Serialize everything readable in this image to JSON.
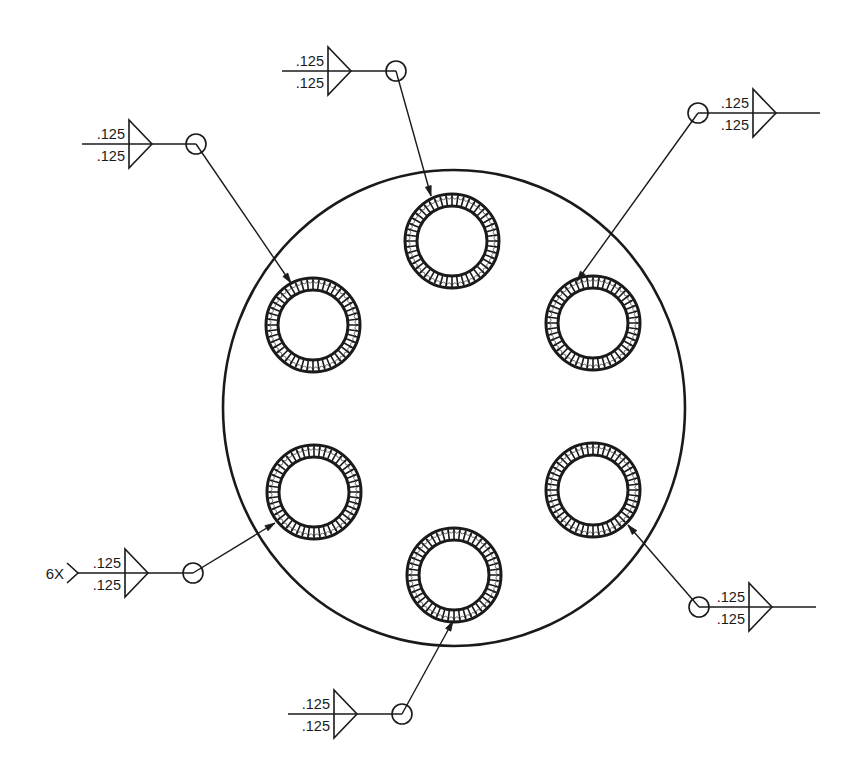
{
  "diagram": {
    "title": "",
    "type": "weld-symbol-drawing",
    "stroke_color": "#1a1a1a",
    "background": "#ffffff",
    "plate": {
      "shape": "circle",
      "center": [
        454,
        408
      ],
      "rx": 231,
      "ry": 238
    },
    "holes": [
      {
        "id": "top",
        "center": [
          452,
          241
        ]
      },
      {
        "id": "upper-left",
        "center": [
          313,
          325
        ]
      },
      {
        "id": "upper-right",
        "center": [
          593,
          323
        ]
      },
      {
        "id": "lower-left",
        "center": [
          314,
          492
        ]
      },
      {
        "id": "lower-right",
        "center": [
          593,
          490
        ]
      },
      {
        "id": "bottom",
        "center": [
          454,
          575
        ]
      }
    ],
    "weld_ring": {
      "outer_radius": 47,
      "inner_radius": 35,
      "tick_count": 48
    },
    "weld_callouts": [
      {
        "id": "top",
        "top_size": ".125",
        "bottom_size": ".125",
        "tail_prefix": "",
        "direction": "left",
        "ref_line": [
          282,
          71,
          396
        ],
        "flag_x": 328,
        "apex_x": 351,
        "circle": [
          396,
          71
        ],
        "arrow_to": [
          431,
          196
        ]
      },
      {
        "id": "upper-left",
        "top_size": ".125",
        "bottom_size": ".125",
        "tail_prefix": "",
        "direction": "left",
        "ref_line": [
          82,
          144,
          196
        ],
        "flag_x": 129,
        "apex_x": 152,
        "circle": [
          196,
          144
        ],
        "arrow_to": [
          291,
          283
        ]
      },
      {
        "id": "upper-right",
        "top_size": ".125",
        "bottom_size": ".125",
        "tail_prefix": "",
        "direction": "right",
        "ref_line": [
          698,
          113,
          820
        ],
        "flag_x": 753,
        "apex_x": 776,
        "circle": [
          698,
          113
        ],
        "arrow_to": [
          577,
          281
        ]
      },
      {
        "id": "lower-left",
        "top_size": ".125",
        "bottom_size": ".125",
        "tail_prefix": "6X",
        "direction": "left",
        "ref_line": [
          78,
          573,
          193
        ],
        "flag_x": 125,
        "apex_x": 148,
        "circle": [
          193,
          573
        ],
        "arrow_to": [
          275,
          523
        ]
      },
      {
        "id": "lower-right",
        "top_size": ".125",
        "bottom_size": ".125",
        "tail_prefix": "",
        "direction": "right",
        "ref_line": [
          699,
          607,
          816
        ],
        "flag_x": 749,
        "apex_x": 772,
        "circle": [
          699,
          607
        ],
        "arrow_to": [
          628,
          525
        ]
      },
      {
        "id": "bottom",
        "top_size": ".125",
        "bottom_size": ".125",
        "tail_prefix": "",
        "direction": "left",
        "ref_line": [
          288,
          714,
          402
        ],
        "flag_x": 334,
        "apex_x": 357,
        "circle": [
          402,
          714
        ],
        "arrow_to": [
          453,
          621
        ]
      }
    ]
  }
}
